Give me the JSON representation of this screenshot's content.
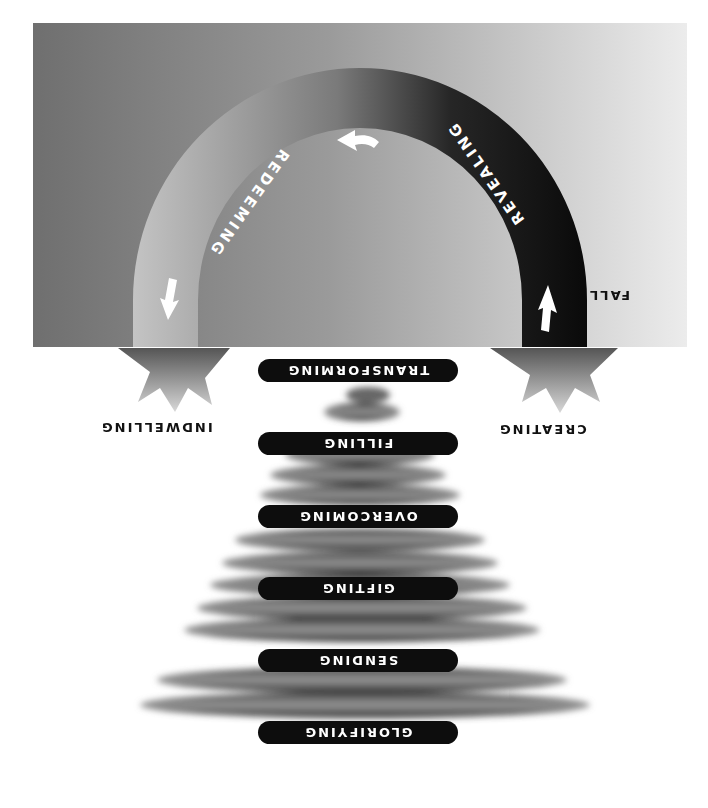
{
  "diagram": {
    "orientation": "rotated-180",
    "arch": {
      "labels": {
        "revealing": "REVEALING",
        "redeeming": "REDEEMING"
      },
      "side_label": "FALL"
    },
    "bursts": {
      "left": "INDWELLING",
      "right": "CREATING"
    },
    "spiral_pills": [
      {
        "label": "TRANSFORMING"
      },
      {
        "label": "FILLING"
      },
      {
        "label": "OVERCOMING"
      },
      {
        "label": "GIFTING"
      },
      {
        "label": "SENDING"
      },
      {
        "label": "GLORIFYING"
      }
    ],
    "colors": {
      "pill": "#0d0d0d",
      "arch_dark": "#111111",
      "arch_light": "#bdbdbd",
      "panel_light": "#ececec",
      "panel_dark": "#6f6f6f"
    }
  }
}
